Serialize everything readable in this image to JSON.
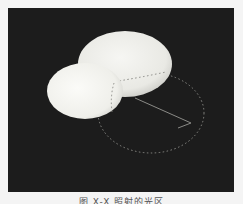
{
  "figure": {
    "background_color": "#1c1c1c",
    "page_color": "#f4f4f4",
    "light_spot_color": "#f2f2ef",
    "outline_color": "#8a8a86",
    "elements": {
      "large_light_spot": {
        "cx": 117,
        "cy": 56,
        "rx": 47,
        "ry": 33
      },
      "small_light_spot": {
        "cx": 77,
        "cy": 83,
        "rx": 38,
        "ry": 28
      },
      "dotted_circle": {
        "cx": 143,
        "cy": 105,
        "rx": 53,
        "ry": 40
      },
      "radius_line": {
        "x1": 127,
        "y1": 90,
        "x2": 183,
        "y2": 115
      }
    }
  },
  "caption": {
    "text": "图 X-X   照射的光区"
  }
}
